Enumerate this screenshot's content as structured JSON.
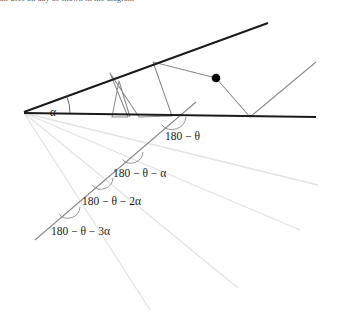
{
  "figure": {
    "type": "geometric-diagram",
    "background_color": "#ffffff",
    "cropped_caption_text": "an uses on day as shown in the diagram"
  },
  "colors": {
    "stroke_dark": "#1a1a1a",
    "stroke_mid": "#7a7a7a",
    "stroke_light": "#e0e0e0",
    "dot_fill": "#000000",
    "text": "#1a1a1a"
  },
  "labels": {
    "alpha": "α",
    "angle_0": "180 − θ",
    "angle_1": "180 − θ − α",
    "angle_2": "180 − θ − 2α",
    "angle_3": "180 − θ − 3α"
  },
  "geometry": {
    "apex": [
      24,
      112
    ],
    "base_line": {
      "from": [
        24,
        113
      ],
      "to": [
        316,
        117
      ]
    },
    "upper_wedge_line": {
      "from": [
        24,
        112
      ],
      "to": [
        268,
        23
      ]
    },
    "wedge_angle_label_pos": [
      52,
      110
    ],
    "dot": {
      "center": [
        216,
        78
      ],
      "radius": 4
    },
    "trajectory_points": [
      [
        130,
        117
      ],
      [
        119,
        81
      ],
      [
        112,
        117
      ],
      [
        128,
        117
      ],
      [
        110,
        73
      ],
      [
        139,
        117
      ],
      [
        172,
        116
      ],
      [
        153,
        62
      ],
      [
        216,
        78
      ],
      [
        250,
        117
      ],
      [
        316,
        62
      ]
    ],
    "fan_rays": [
      {
        "from": [
          24,
          113
        ],
        "to": [
          318,
          185
        ]
      },
      {
        "from": [
          24,
          113
        ],
        "to": [
          300,
          230
        ]
      },
      {
        "from": [
          24,
          113
        ],
        "to": [
          238,
          288
        ]
      },
      {
        "from": [
          24,
          113
        ],
        "to": [
          150,
          310
        ]
      }
    ],
    "transversal": {
      "from": [
        196,
        102
      ],
      "to": [
        35,
        240
      ]
    },
    "angle_arcs": [
      {
        "at": [
          172,
          116
        ],
        "r": 14,
        "label_pos": [
          178,
          137
        ],
        "label_key": "angle_0"
      },
      {
        "at": [
          131,
          152
        ],
        "r": 12,
        "label_pos": [
          120,
          177
        ],
        "label_key": "angle_1"
      },
      {
        "at": [
          101,
          178
        ],
        "r": 12,
        "label_pos": [
          87,
          202
        ],
        "label_key": "angle_2"
      },
      {
        "at": [
          68,
          207
        ],
        "r": 12,
        "label_pos": [
          52,
          233
        ],
        "label_key": "angle_3"
      }
    ]
  }
}
